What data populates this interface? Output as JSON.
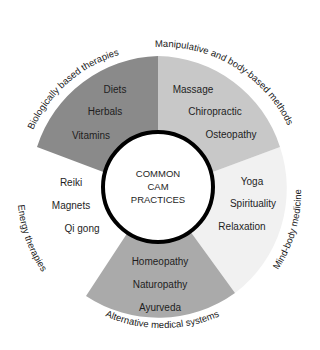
{
  "diagram": {
    "center": {
      "lines": [
        "COMMON",
        "CAM",
        "PRACTICES"
      ]
    },
    "colors": {
      "biologically": "#8a8a8a",
      "manipulative": "#c8c8c8",
      "mind_body": "#f1f1f1",
      "alternative": "#aaaaaa",
      "energy": "#ffffff",
      "ring": "#000000"
    },
    "segments": [
      {
        "id": "biologically-based-therapies",
        "title": "Biologically based therapies",
        "items": [
          "Diets",
          "Herbals",
          "Vitamins"
        ]
      },
      {
        "id": "manipulative-body-based",
        "title": "Manipulative and body-based methods",
        "items": [
          "Massage",
          "Chiropractic",
          "Osteopathy"
        ]
      },
      {
        "id": "mind-body-medicine",
        "title": "Mind-body medicine",
        "items": [
          "Yoga",
          "Spirituality",
          "Relaxation"
        ]
      },
      {
        "id": "alternative-medical-systems",
        "title": "Alternative medical systems",
        "items": [
          "Homeopathy",
          "Naturopathy",
          "Ayurveda"
        ]
      },
      {
        "id": "energy-therapies",
        "title": "Energy therapies",
        "items": [
          "Reiki",
          "Magnets",
          "Qi gong"
        ]
      }
    ]
  }
}
